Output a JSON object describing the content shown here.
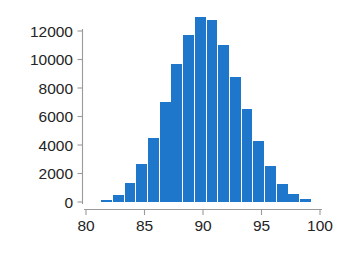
{
  "chart_data": {
    "type": "bar",
    "title": "",
    "subtitle": "",
    "xlabel": "",
    "ylabel": "",
    "xlim": [
      80,
      100
    ],
    "ylim": [
      0,
      13200
    ],
    "grid": false,
    "legend": null,
    "bar_color": "#1f77cc",
    "bin_width": 1,
    "categories": [
      "81.3",
      "82.3",
      "83.3",
      "84.3",
      "85.3",
      "86.3",
      "87.3",
      "88.3",
      "89.3",
      "90.3",
      "91.3",
      "92.3",
      "93.3",
      "94.3",
      "95.3",
      "96.3",
      "97.3",
      "98.3"
    ],
    "bin_starts": [
      81.3,
      82.3,
      83.3,
      84.3,
      85.3,
      86.3,
      87.3,
      88.3,
      89.3,
      90.3,
      91.3,
      92.3,
      93.3,
      94.3,
      95.3,
      96.3,
      97.3,
      98.3
    ],
    "values": [
      150,
      500,
      1350,
      2650,
      4500,
      7050,
      9700,
      11750,
      13000,
      12750,
      11000,
      8750,
      6500,
      4250,
      2550,
      1250,
      550,
      180
    ],
    "xticks": [
      80,
      85,
      90,
      95,
      100
    ],
    "xtick_labels": [
      "80",
      "85",
      "90",
      "95",
      "100"
    ],
    "yticks": [
      0,
      2000,
      4000,
      6000,
      8000,
      10000,
      12000
    ],
    "ytick_labels": [
      "0",
      "2000",
      "4000",
      "6000",
      "8000",
      "10000",
      "12000"
    ],
    "axis_color": "#9a9a9a",
    "text_color": "#242424"
  }
}
